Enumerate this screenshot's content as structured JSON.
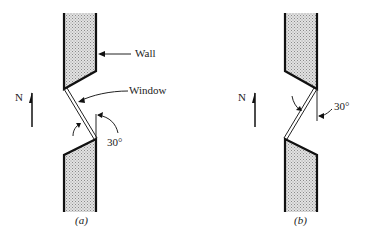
{
  "figure_a": {
    "caption": "(a)",
    "north_label": "N",
    "wall_label": "Wall",
    "window_label": "Window",
    "angle_label": "30°",
    "window_angle_deg": 30
  },
  "figure_b": {
    "caption": "(b)",
    "north_label": "N",
    "angle_label": "30°",
    "window_angle_deg": 30
  },
  "colors": {
    "line": "#111111",
    "wall_fill": "#c8c8c8"
  }
}
